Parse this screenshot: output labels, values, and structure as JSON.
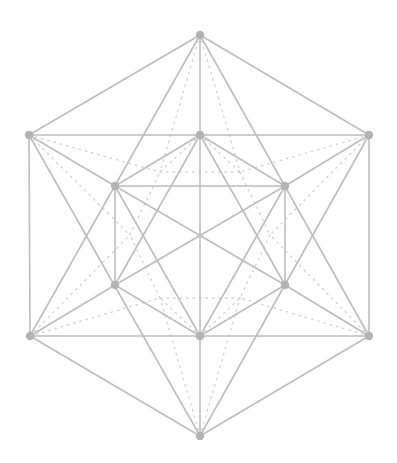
{
  "diagram": {
    "type": "polyhedron-projection",
    "colors": {
      "edge": "#bdbdbd",
      "hidden_edge": "#cfcfcf",
      "vertex": "#b3b3b3",
      "background": "#ffffff"
    },
    "vertices": [
      {
        "id": "top",
        "x": 200,
        "y": 35
      },
      {
        "id": "upper-left",
        "x": 29,
        "y": 135
      },
      {
        "id": "upper-mid",
        "x": 200,
        "y": 135
      },
      {
        "id": "upper-right",
        "x": 369,
        "y": 135
      },
      {
        "id": "inner-upper-left",
        "x": 115,
        "y": 186
      },
      {
        "id": "inner-upper-right",
        "x": 285,
        "y": 186
      },
      {
        "id": "inner-lower-left",
        "x": 115,
        "y": 285
      },
      {
        "id": "inner-lower-right",
        "x": 285,
        "y": 285
      },
      {
        "id": "lower-left",
        "x": 30,
        "y": 336
      },
      {
        "id": "lower-mid",
        "x": 200,
        "y": 336
      },
      {
        "id": "lower-right",
        "x": 369,
        "y": 336
      },
      {
        "id": "bottom",
        "x": 200,
        "y": 436
      }
    ],
    "hidden_vertices": [
      {
        "id": "h-top-left",
        "x": 160,
        "y": 172
      },
      {
        "id": "h-top-right",
        "x": 240,
        "y": 172
      },
      {
        "id": "h-mid-left",
        "x": 130,
        "y": 235
      },
      {
        "id": "h-mid-right",
        "x": 270,
        "y": 235
      },
      {
        "id": "h-bot-left",
        "x": 160,
        "y": 298
      },
      {
        "id": "h-bot-right",
        "x": 240,
        "y": 298
      }
    ],
    "edges": [
      [
        "top",
        "upper-left"
      ],
      [
        "top",
        "upper-right"
      ],
      [
        "upper-left",
        "lower-left"
      ],
      [
        "upper-right",
        "lower-right"
      ],
      [
        "lower-left",
        "bottom"
      ],
      [
        "lower-right",
        "bottom"
      ],
      [
        "upper-left",
        "upper-mid"
      ],
      [
        "upper-mid",
        "upper-right"
      ],
      [
        "lower-left",
        "lower-mid"
      ],
      [
        "lower-mid",
        "lower-right"
      ],
      [
        "top",
        "upper-mid"
      ],
      [
        "upper-mid",
        "lower-mid"
      ],
      [
        "lower-mid",
        "bottom"
      ],
      [
        "top",
        "lower-left"
      ],
      [
        "top",
        "lower-right"
      ],
      [
        "upper-left",
        "bottom"
      ],
      [
        "upper-right",
        "bottom"
      ],
      [
        "upper-left",
        "inner-upper-left"
      ],
      [
        "upper-right",
        "inner-upper-right"
      ],
      [
        "lower-left",
        "inner-lower-left"
      ],
      [
        "lower-right",
        "inner-lower-right"
      ],
      [
        "upper-mid",
        "inner-upper-left"
      ],
      [
        "upper-mid",
        "inner-upper-right"
      ],
      [
        "lower-mid",
        "inner-lower-left"
      ],
      [
        "lower-mid",
        "inner-lower-right"
      ],
      [
        "inner-upper-left",
        "inner-upper-right"
      ],
      [
        "inner-upper-left",
        "inner-lower-left"
      ],
      [
        "inner-upper-right",
        "inner-lower-right"
      ],
      [
        "inner-upper-left",
        "inner-lower-right"
      ],
      [
        "inner-upper-right",
        "inner-lower-left"
      ],
      [
        "inner-upper-left",
        "lower-mid"
      ],
      [
        "inner-upper-right",
        "lower-mid"
      ],
      [
        "inner-lower-left",
        "upper-mid"
      ],
      [
        "inner-lower-right",
        "upper-mid"
      ]
    ],
    "hidden_edges": [
      [
        "top",
        "h-top-left"
      ],
      [
        "top",
        "h-top-right"
      ],
      [
        "bottom",
        "h-bot-left"
      ],
      [
        "bottom",
        "h-bot-right"
      ],
      [
        "upper-left",
        "h-top-left"
      ],
      [
        "upper-left",
        "h-mid-left"
      ],
      [
        "upper-right",
        "h-top-right"
      ],
      [
        "upper-right",
        "h-mid-right"
      ],
      [
        "lower-left",
        "h-mid-left"
      ],
      [
        "lower-left",
        "h-bot-left"
      ],
      [
        "lower-right",
        "h-mid-right"
      ],
      [
        "lower-right",
        "h-bot-right"
      ],
      [
        "h-top-left",
        "h-top-right"
      ],
      [
        "h-top-right",
        "h-mid-right"
      ],
      [
        "h-mid-right",
        "h-bot-right"
      ],
      [
        "h-bot-right",
        "h-bot-left"
      ],
      [
        "h-bot-left",
        "h-mid-left"
      ],
      [
        "h-mid-left",
        "h-top-left"
      ],
      [
        "upper-mid",
        "h-top-left"
      ],
      [
        "upper-mid",
        "h-top-right"
      ],
      [
        "lower-mid",
        "h-bot-left"
      ],
      [
        "lower-mid",
        "h-bot-right"
      ]
    ]
  }
}
